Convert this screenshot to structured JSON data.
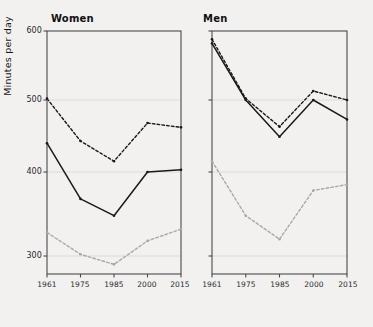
{
  "chart_data": {
    "type": "line",
    "title": "",
    "xlabel": "",
    "ylabel": "Minutes per day",
    "categories": [
      "1961",
      "1975",
      "1985",
      "2000",
      "2015"
    ],
    "x_tick_labels": [
      "1961",
      "1975",
      "1985",
      "2000",
      "2015"
    ],
    "y_tick_labels": [
      "600",
      "500",
      "400",
      "300"
    ],
    "y_ticks": [
      600,
      500,
      400,
      300
    ],
    "ylim": [
      250,
      600
    ],
    "xlim": [
      1961,
      2015
    ],
    "grid": "horizontal",
    "legend": "none",
    "panels": [
      {
        "name": "women-panel",
        "title": "Women",
        "series": [
          {
            "name": "women-dashed-upper",
            "style": "dashed",
            "color": "#1a1a1c",
            "values": [
              502,
              443,
              415,
              468,
              462
            ]
          },
          {
            "name": "women-solid",
            "style": "solid",
            "color": "#1a1a1c",
            "values": [
              440,
              368,
              348,
              400,
              403
            ]
          },
          {
            "name": "women-dashed-lower",
            "style": "dashed",
            "color": "#a9a9ab",
            "values": [
              328,
              302,
              290,
              318,
              332
            ]
          }
        ]
      },
      {
        "name": "men-panel",
        "title": "Men",
        "series": [
          {
            "name": "men-dashed-upper",
            "style": "dashed",
            "color": "#1a1a1c",
            "values": [
              588,
              502,
              463,
              513,
              500
            ]
          },
          {
            "name": "men-solid",
            "style": "solid",
            "color": "#1a1a1c",
            "values": [
              582,
              500,
              449,
              500,
              473
            ]
          },
          {
            "name": "men-dashed-lower",
            "style": "dashed",
            "color": "#a9a9ab",
            "values": [
              415,
              348,
              320,
              378,
              385
            ]
          }
        ]
      }
    ]
  },
  "colors": {
    "background": "#f2f1ef",
    "axis": "#4a4a4c",
    "grid": "#d8d7d4",
    "primary": "#1a1a1c",
    "secondary": "#a9a9ab"
  }
}
